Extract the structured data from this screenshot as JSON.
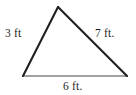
{
  "figure": {
    "kind": "geometry-triangle-figure",
    "background_color": "#ffffff",
    "stroke_color_slanted_sides": "#231f20",
    "stroke_color_base": "#808285",
    "text_color": "#231f20",
    "vertices": {
      "apex": {
        "x": 58,
        "y": 7
      },
      "bottom_left": {
        "x": 23,
        "y": 76
      },
      "bottom_right": {
        "x": 127,
        "y": 76
      }
    },
    "labels": {
      "left_side": "3 ft",
      "right_side": "7 ft.",
      "bottom_side": "6 ft."
    },
    "measurements": [
      {
        "side": "left",
        "value": 3,
        "unit": "ft",
        "label": "3 ft"
      },
      {
        "side": "right",
        "value": 7,
        "unit": "ft",
        "label": "7 ft."
      },
      {
        "side": "bottom",
        "value": 6,
        "unit": "ft",
        "label": "6 ft."
      }
    ]
  }
}
